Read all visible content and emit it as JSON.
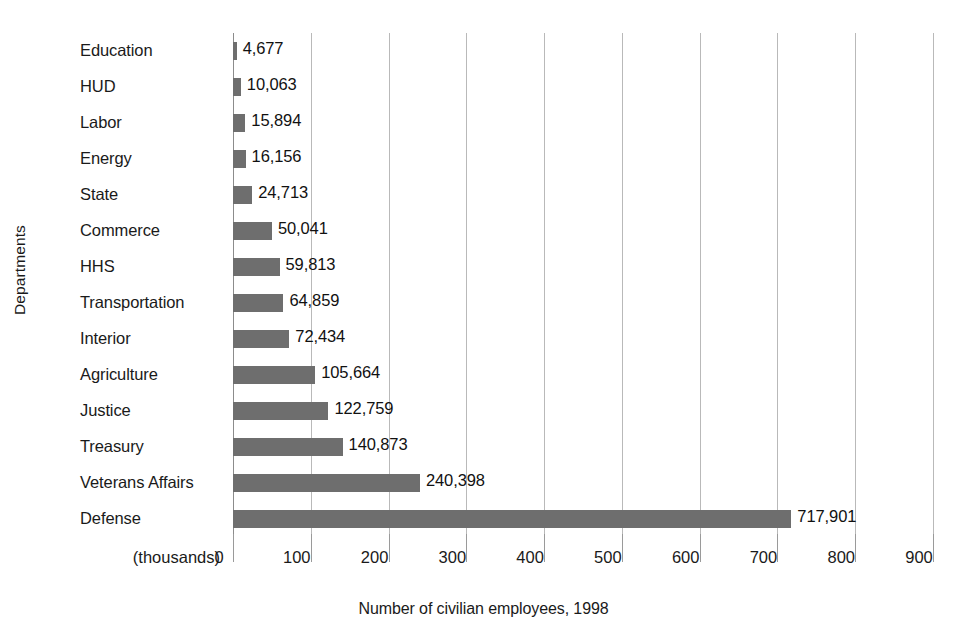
{
  "chart_data": {
    "type": "bar",
    "orientation": "horizontal",
    "title": "",
    "xlabel": "Number of civilian employees, 1998",
    "ylabel": "Departments",
    "unit_note": "(thousands)",
    "xlim": [
      0,
      900
    ],
    "xticks": [
      0,
      100,
      200,
      300,
      400,
      500,
      600,
      700,
      800,
      900
    ],
    "xtick_labels": [
      "0",
      "100",
      "200",
      "300",
      "400",
      "500",
      "600",
      "700",
      "800",
      "900"
    ],
    "grid": "vertical",
    "legend": "none",
    "bar_color": "#6e6e6e",
    "gridline_color": "#b9b9b9",
    "categories": [
      "Education",
      "HUD",
      "Labor",
      "Energy",
      "State",
      "Commerce",
      "HHS",
      "Transportation",
      "Interior",
      "Agriculture",
      "Justice",
      "Treasury",
      "Veterans Affairs",
      "Defense"
    ],
    "values": [
      4677,
      10063,
      15894,
      16156,
      24713,
      50041,
      59813,
      64859,
      72434,
      105664,
      122759,
      140873,
      240398,
      717901
    ],
    "value_labels": [
      "4,677",
      "10,063",
      "15,894",
      "16,156",
      "24,713",
      "50,041",
      "59,813",
      "64,859",
      "72,434",
      "105,664",
      "122,759",
      "140,873",
      "240,398",
      "717,901"
    ]
  }
}
